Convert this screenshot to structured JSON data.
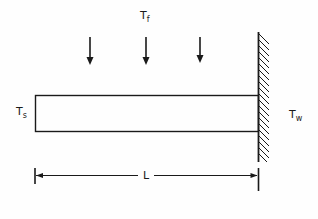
{
  "diagram": {
    "type": "fin attached to wall with convective fluid",
    "labels": {
      "fluid_temp": {
        "main": "T",
        "sub": "f"
      },
      "tip_temp": {
        "main": "T",
        "sub": "s"
      },
      "wall_temp": {
        "main": "T",
        "sub": "w"
      },
      "length": "L"
    },
    "arrows": {
      "count": 3,
      "direction": "down"
    },
    "colors": {
      "stroke": "#1a1a1a",
      "background": "#fefefe"
    }
  }
}
